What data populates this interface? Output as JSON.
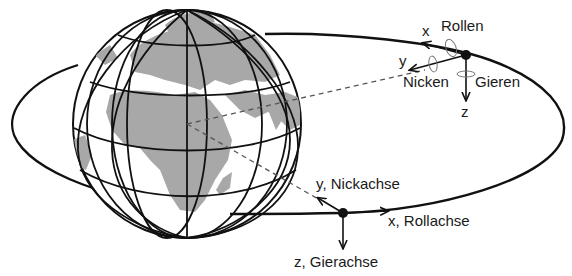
{
  "diagram": {
    "colors": {
      "line": "#111111",
      "land": "#a8a8a8",
      "ocean": "#ffffff",
      "dashed": "#555555",
      "rotation": "#666666"
    },
    "globe": {
      "cx": 187,
      "cy": 124,
      "r": 114
    },
    "orbit": {
      "cx": 289,
      "cy": 124,
      "rx": 277,
      "ry": 91
    },
    "satellite_top": {
      "position": [
        466,
        55
      ],
      "labels": {
        "x": "x",
        "y": "y",
        "z": "z",
        "roll": "Rollen",
        "pitch": "Nicken",
        "yaw": "Gieren"
      }
    },
    "satellite_bottom": {
      "position": [
        343,
        213
      ],
      "labels": {
        "y_axis": "y, Nickachse",
        "x_axis": "x, Rollachse",
        "z_axis": "z, Gierachse"
      }
    }
  }
}
